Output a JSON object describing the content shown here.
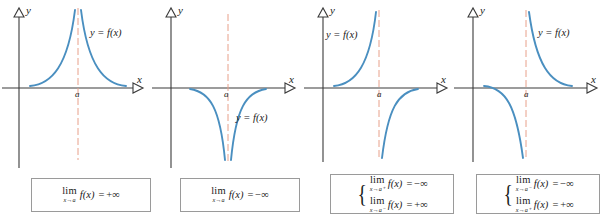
{
  "figure": {
    "curve_color": "#4a8fc0",
    "asymptote_color": "#e8a08a",
    "axis_color": "#3a3a3a",
    "box_border_color": "#9a9a9a"
  },
  "labels": {
    "y_axis": "y",
    "x_axis": "x",
    "point_a": "a",
    "function": "y = f(x)",
    "lim": "lim",
    "equals": "=",
    "plus_infinity": "+∞",
    "minus_infinity": "−∞",
    "brace": "{"
  },
  "panels": [
    {
      "id": "panel-1",
      "name": "two-sided-plus-infinity",
      "function_label": "y = f(x)",
      "a_label": "a",
      "y_label": "y",
      "x_label": "x",
      "branch_left": "rises to +∞ as x→a⁻",
      "branch_right": "rises to +∞ as x→a⁺",
      "formula_lines": [
        {
          "lim": "lim",
          "sub": "x→a",
          "body": "f(x)",
          "eq": "=",
          "value": "+∞"
        }
      ]
    },
    {
      "id": "panel-2",
      "name": "two-sided-minus-infinity",
      "function_label": "y = f(x)",
      "a_label": "a",
      "y_label": "y",
      "x_label": "x",
      "branch_left": "falls to −∞ as x→a⁻",
      "branch_right": "falls to −∞ as x→a⁺",
      "formula_lines": [
        {
          "lim": "lim",
          "sub": "x→a",
          "body": "f(x)",
          "eq": "=",
          "value": "−∞"
        }
      ]
    },
    {
      "id": "panel-3",
      "name": "left-plus-right-minus",
      "function_label": "y = f(x)",
      "a_label": "a",
      "y_label": "y",
      "x_label": "x",
      "branch_left": "rises to +∞ as x→a⁻",
      "branch_right": "comes from −∞ as x→a⁺",
      "formula_lines": [
        {
          "lim": "lim",
          "sub": "x→a⁺",
          "body": "f(x)",
          "eq": "=",
          "value": "−∞"
        },
        {
          "lim": "lim",
          "sub": "x→a⁻",
          "body": "f(x)",
          "eq": "=",
          "value": "+∞"
        }
      ]
    },
    {
      "id": "panel-4",
      "name": "left-minus-right-plus",
      "function_label": "y = f(x)",
      "a_label": "a",
      "y_label": "y",
      "x_label": "x",
      "branch_left": "falls to −∞ as x→a⁻",
      "branch_right": "comes from +∞ as x→a⁺",
      "formula_lines": [
        {
          "lim": "lim",
          "sub": "x→a⁻",
          "body": "f(x)",
          "eq": "=",
          "value": "−∞"
        },
        {
          "lim": "lim",
          "sub": "x→a⁺",
          "body": "f(x)",
          "eq": "=",
          "value": "+∞"
        }
      ]
    }
  ]
}
